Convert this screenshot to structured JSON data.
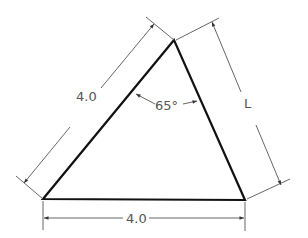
{
  "diagram": {
    "type": "dimensioned-triangle",
    "vertices": {
      "top": [
        174,
        40
      ],
      "bottom_left": [
        43,
        199
      ],
      "bottom_right": [
        245,
        200
      ]
    },
    "labels": {
      "left_side": "4.0",
      "bottom_side": "4.0",
      "right_side": "L",
      "angle": "65°"
    },
    "colors": {
      "object_line": "#111111",
      "dimension_line": "#555555",
      "text": "#555555"
    }
  }
}
